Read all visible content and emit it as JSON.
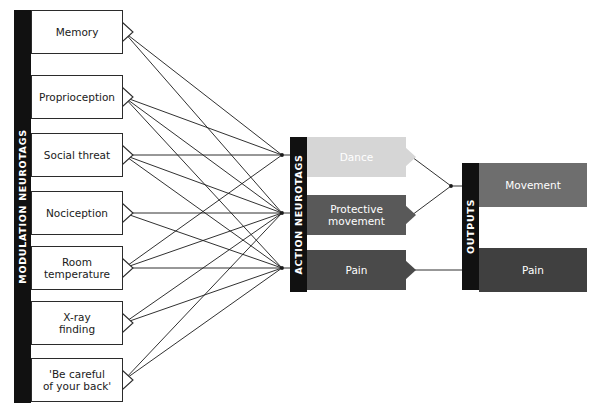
{
  "diagram": {
    "background": "#ffffff",
    "line_color": "#1a1a1a"
  },
  "columns": [
    {
      "id": "modulation",
      "label": "MODULATION NEUROTAGS",
      "bar_color": "#111111"
    },
    {
      "id": "action",
      "label": "ACTION NEUROTAGS",
      "bar_color": "#111111"
    },
    {
      "id": "outputs",
      "label": "OUTPUTS",
      "bar_color": "#111111"
    }
  ],
  "modulation_nodes": [
    {
      "id": "memory",
      "label": "Memory",
      "fill": "#ffffff",
      "text_color": "#1a1a1a"
    },
    {
      "id": "proprio",
      "label": "Proprioception",
      "fill": "#ffffff",
      "text_color": "#1a1a1a"
    },
    {
      "id": "social",
      "label": "Social threat",
      "fill": "#ffffff",
      "text_color": "#1a1a1a"
    },
    {
      "id": "nociception",
      "label": "Nociception",
      "fill": "#ffffff",
      "text_color": "#1a1a1a"
    },
    {
      "id": "roomtemp",
      "label": "Room\ntemperature",
      "fill": "#ffffff",
      "text_color": "#1a1a1a"
    },
    {
      "id": "xray",
      "label": "X-ray\nfinding",
      "fill": "#ffffff",
      "text_color": "#1a1a1a"
    },
    {
      "id": "becareful",
      "label": "'Be careful\nof your back'",
      "fill": "#ffffff",
      "text_color": "#1a1a1a"
    }
  ],
  "action_nodes": [
    {
      "id": "dance",
      "label": "Dance",
      "fill": "#d6d6d6",
      "text_color": "#ffffff"
    },
    {
      "id": "protective",
      "label": "Protective\nmovement",
      "fill": "#595959",
      "text_color": "#ffffff"
    },
    {
      "id": "pain_action",
      "label": "Pain",
      "fill": "#4a4a4a",
      "text_color": "#ffffff"
    }
  ],
  "output_nodes": [
    {
      "id": "movement",
      "label": "Movement",
      "fill": "#6e6e6e",
      "text_color": "#ffffff"
    },
    {
      "id": "pain_output",
      "label": "Pain",
      "fill": "#404040",
      "text_color": "#ffffff"
    }
  ]
}
